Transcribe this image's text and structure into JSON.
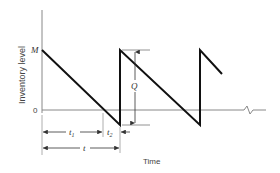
{
  "diagram": {
    "y_axis_label": "Inventory level",
    "x_axis_label": "Time",
    "level_labels": {
      "max": "M",
      "zero": "0"
    },
    "dimension_labels": {
      "order_quantity": "Q",
      "t1": "t",
      "t1_sub": "1",
      "t2": "t",
      "t2_sub": "2",
      "cycle": "t"
    },
    "colors": {
      "line": "#111111",
      "axis": "#888888",
      "text": "#333333"
    }
  }
}
